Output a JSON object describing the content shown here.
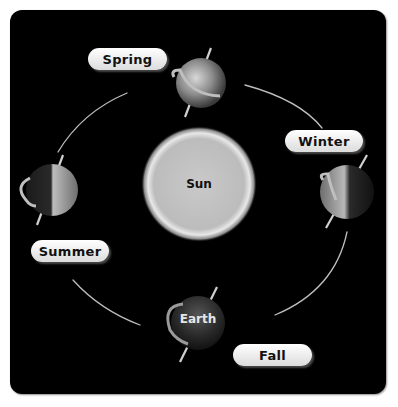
{
  "diagram": {
    "center_label": "Sun",
    "earth_label": "Earth",
    "seasons": [
      {
        "name": "Spring",
        "position": "top"
      },
      {
        "name": "Winter",
        "position": "right"
      },
      {
        "name": "Summer",
        "position": "left"
      },
      {
        "name": "Fall",
        "position": "bottom"
      }
    ]
  },
  "colors": {
    "background": "#000000",
    "label_fill": "#f2f2f2",
    "orbit_line": "#bdbdbd",
    "sun": "#cfcfcf"
  }
}
